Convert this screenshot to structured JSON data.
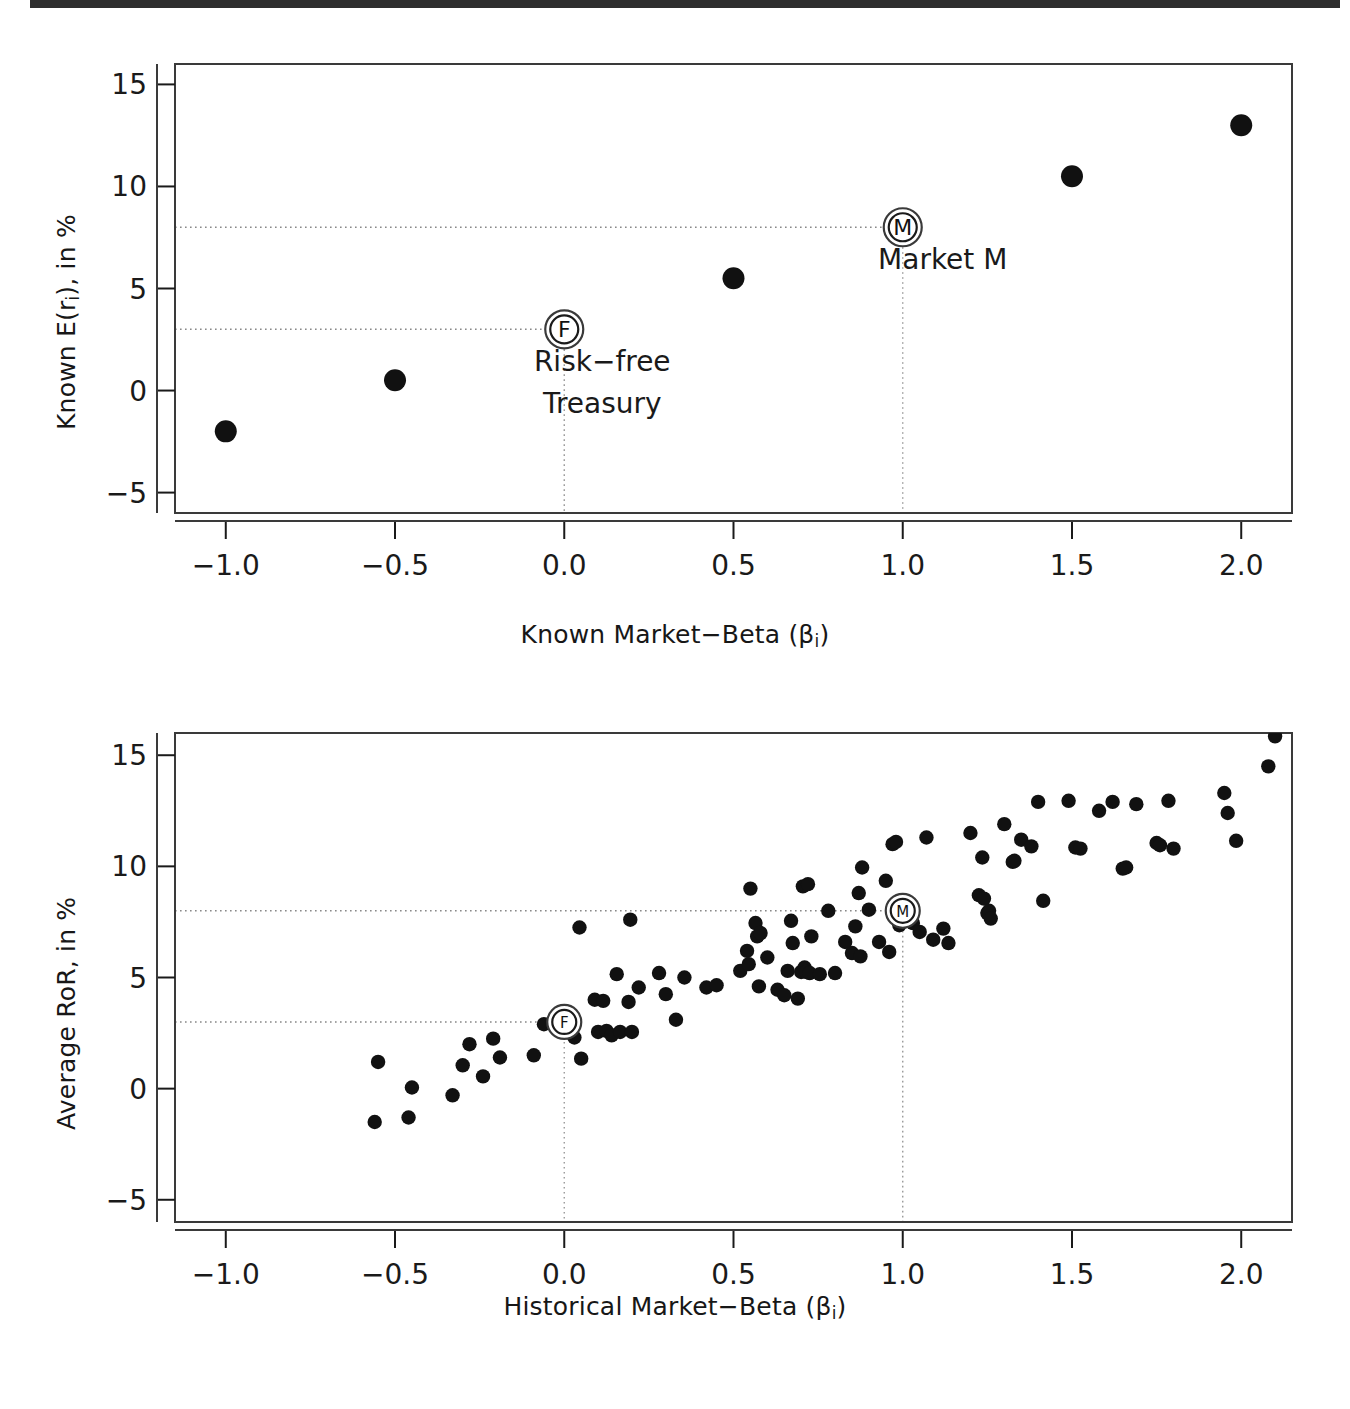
{
  "figure": {
    "background_color": "#ffffff",
    "ink_color": "#1a1a1a",
    "top_rule_color": "#2e2e2e",
    "marker_color": "#111111"
  },
  "chart_data": [
    {
      "type": "scatter",
      "panel": "top",
      "title": "",
      "xlabel": "Known Market−Beta (βi)",
      "xlabel_base": "Known Market−Beta (β",
      "xlabel_sub": "i",
      "xlabel_tail": ")",
      "ylabel": "Known E(ri), in %",
      "ylabel_base": "Known E(r",
      "ylabel_sub": "i",
      "ylabel_tail": "), in %",
      "xlim": [
        -1.15,
        2.15
      ],
      "ylim": [
        -6.0,
        16.0
      ],
      "xticks": [
        -1.0,
        -0.5,
        0.0,
        0.5,
        1.0,
        1.5,
        2.0
      ],
      "xticklabels": [
        "−1.0",
        "−0.5",
        "0.0",
        "0.5",
        "1.0",
        "1.5",
        "2.0"
      ],
      "yticks": [
        -5,
        0,
        5,
        10,
        15
      ],
      "yticklabels": [
        "−5",
        "0",
        "5",
        "10",
        "15"
      ],
      "grid": false,
      "legend": "none",
      "x": [
        -1.0,
        -0.5,
        0.0,
        0.5,
        1.0,
        1.5,
        2.0
      ],
      "y": [
        -2.0,
        0.5,
        3.0,
        5.5,
        8.0,
        10.5,
        13.0
      ],
      "guide_lines": {
        "horizontal": [
          3.0,
          8.0
        ],
        "vertical": [
          0.0,
          1.0
        ],
        "style": "dotted"
      },
      "annotations": [
        {
          "label": "F",
          "marker": "double-circle",
          "x": 0.0,
          "y": 3.0,
          "text": "Risk−free\nTreasury",
          "text_line1": "Risk−free",
          "text_line2": "Treasury"
        },
        {
          "label": "M",
          "marker": "double-circle",
          "x": 1.0,
          "y": 8.0,
          "text": "Market M",
          "text_line1": "Market M",
          "text_line2": ""
        }
      ]
    },
    {
      "type": "scatter",
      "panel": "bottom",
      "title": "",
      "xlabel": "Historical Market−Beta (βi)",
      "xlabel_base": "Historical Market−Beta (β",
      "xlabel_sub": "i",
      "xlabel_tail": ")",
      "ylabel": "Average RoR, in %",
      "ylabel_base": "Average RoR, in %",
      "ylabel_sub": "",
      "ylabel_tail": "",
      "xlim": [
        -1.15,
        2.15
      ],
      "ylim": [
        -6.0,
        16.0
      ],
      "xticks": [
        -1.0,
        -0.5,
        0.0,
        0.5,
        1.0,
        1.5,
        2.0
      ],
      "xticklabels": [
        "−1.0",
        "−0.5",
        "0.0",
        "0.5",
        "1.0",
        "1.5",
        "2.0"
      ],
      "yticks": [
        -5,
        0,
        5,
        10,
        15
      ],
      "yticklabels": [
        "−5",
        "0",
        "5",
        "10",
        "15"
      ],
      "grid": false,
      "legend": "none",
      "guide_lines": {
        "horizontal": [
          3.0,
          8.0
        ],
        "vertical": [
          0.0,
          1.0
        ],
        "style": "dotted"
      },
      "points": [
        [
          -0.56,
          -1.5
        ],
        [
          -0.55,
          1.2
        ],
        [
          -0.46,
          -1.3
        ],
        [
          -0.45,
          0.05
        ],
        [
          -0.33,
          -0.3
        ],
        [
          -0.3,
          1.05
        ],
        [
          -0.28,
          2.0
        ],
        [
          -0.24,
          0.55
        ],
        [
          -0.21,
          2.25
        ],
        [
          -0.19,
          1.4
        ],
        [
          -0.09,
          1.5
        ],
        [
          -0.06,
          2.9
        ],
        [
          0.0,
          3.0
        ],
        [
          0.03,
          2.3
        ],
        [
          0.045,
          7.25
        ],
        [
          0.05,
          1.35
        ],
        [
          0.09,
          4.0
        ],
        [
          0.1,
          2.55
        ],
        [
          0.115,
          3.95
        ],
        [
          0.125,
          2.6
        ],
        [
          0.14,
          2.4
        ],
        [
          0.155,
          5.15
        ],
        [
          0.165,
          2.55
        ],
        [
          0.19,
          3.9
        ],
        [
          0.195,
          7.6
        ],
        [
          0.2,
          2.55
        ],
        [
          0.22,
          4.55
        ],
        [
          0.28,
          5.2
        ],
        [
          0.3,
          4.25
        ],
        [
          0.33,
          3.1
        ],
        [
          0.355,
          5.0
        ],
        [
          0.42,
          4.55
        ],
        [
          0.45,
          4.65
        ],
        [
          0.52,
          5.3
        ],
        [
          0.54,
          6.2
        ],
        [
          0.545,
          5.6
        ],
        [
          0.55,
          9.0
        ],
        [
          0.565,
          7.45
        ],
        [
          0.57,
          6.85
        ],
        [
          0.575,
          4.6
        ],
        [
          0.58,
          7.0
        ],
        [
          0.6,
          5.9
        ],
        [
          0.63,
          4.45
        ],
        [
          0.65,
          4.2
        ],
        [
          0.66,
          5.3
        ],
        [
          0.67,
          7.55
        ],
        [
          0.675,
          6.55
        ],
        [
          0.69,
          4.05
        ],
        [
          0.7,
          5.25
        ],
        [
          0.705,
          9.1
        ],
        [
          0.71,
          5.45
        ],
        [
          0.715,
          5.25
        ],
        [
          0.72,
          9.2
        ],
        [
          0.725,
          5.2
        ],
        [
          0.73,
          6.85
        ],
        [
          0.755,
          5.15
        ],
        [
          0.78,
          8.0
        ],
        [
          0.8,
          5.2
        ],
        [
          0.83,
          6.6
        ],
        [
          0.85,
          6.1
        ],
        [
          0.86,
          7.3
        ],
        [
          0.87,
          8.8
        ],
        [
          0.875,
          5.95
        ],
        [
          0.88,
          9.95
        ],
        [
          0.9,
          8.05
        ],
        [
          0.93,
          6.6
        ],
        [
          0.95,
          9.35
        ],
        [
          0.96,
          6.15
        ],
        [
          0.97,
          11.0
        ],
        [
          0.98,
          11.1
        ],
        [
          0.99,
          7.35
        ],
        [
          1.0,
          8.15
        ],
        [
          1.01,
          8.2
        ],
        [
          1.02,
          7.85
        ],
        [
          1.03,
          7.45
        ],
        [
          1.05,
          7.05
        ],
        [
          1.07,
          11.3
        ],
        [
          1.09,
          6.7
        ],
        [
          1.12,
          7.2
        ],
        [
          1.135,
          6.55
        ],
        [
          1.2,
          11.5
        ],
        [
          1.225,
          8.7
        ],
        [
          1.235,
          10.4
        ],
        [
          1.24,
          8.55
        ],
        [
          1.25,
          7.9
        ],
        [
          1.255,
          8.0
        ],
        [
          1.26,
          7.65
        ],
        [
          1.3,
          11.9
        ],
        [
          1.325,
          10.2
        ],
        [
          1.33,
          10.25
        ],
        [
          1.35,
          11.2
        ],
        [
          1.38,
          10.9
        ],
        [
          1.4,
          12.9
        ],
        [
          1.415,
          8.45
        ],
        [
          1.49,
          12.95
        ],
        [
          1.51,
          10.85
        ],
        [
          1.525,
          10.8
        ],
        [
          1.58,
          12.5
        ],
        [
          1.62,
          12.9
        ],
        [
          1.65,
          9.9
        ],
        [
          1.66,
          9.95
        ],
        [
          1.69,
          12.8
        ],
        [
          1.75,
          11.05
        ],
        [
          1.76,
          10.95
        ],
        [
          1.785,
          12.95
        ],
        [
          1.8,
          10.8
        ],
        [
          1.95,
          13.3
        ],
        [
          1.96,
          12.4
        ],
        [
          1.985,
          11.15
        ],
        [
          2.1,
          15.85
        ],
        [
          2.08,
          14.5
        ]
      ],
      "annotations": [
        {
          "label": "F",
          "marker": "double-circle",
          "x": 0.0,
          "y": 3.0,
          "text": "",
          "text_line1": "",
          "text_line2": ""
        },
        {
          "label": "M",
          "marker": "double-circle",
          "x": 1.0,
          "y": 8.0,
          "text": "",
          "text_line1": "",
          "text_line2": ""
        }
      ]
    }
  ]
}
